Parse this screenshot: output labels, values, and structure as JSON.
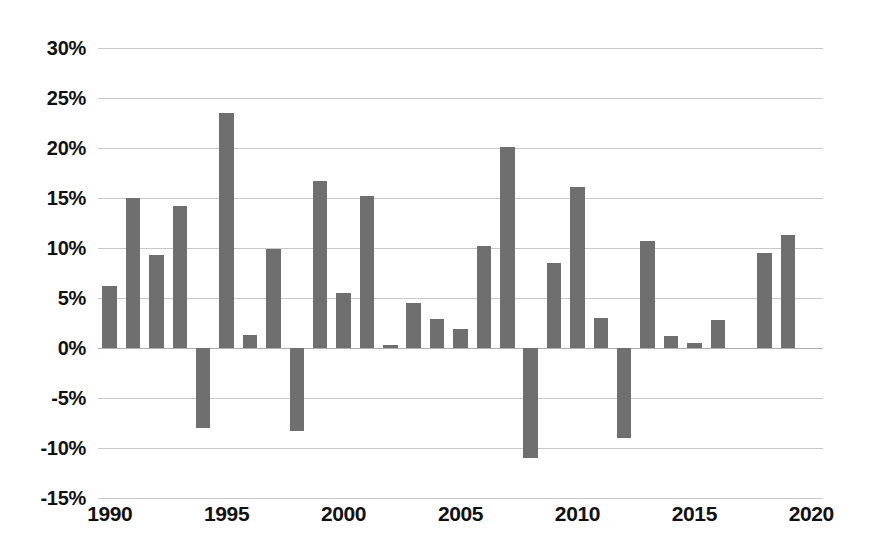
{
  "chart_data": {
    "type": "bar",
    "title": "",
    "subtitle": "",
    "xlabel": "",
    "ylabel": "",
    "categories": [
      "1990",
      "1991",
      "1992",
      "1993",
      "1994",
      "1995",
      "1996",
      "1997",
      "1998",
      "1999",
      "2000",
      "2001",
      "2002",
      "2003",
      "2004",
      "2005",
      "2006",
      "2007",
      "2008",
      "2009",
      "2010",
      "2011",
      "2012",
      "2013",
      "2014",
      "2015",
      "2016",
      "2017",
      "2018",
      "2019"
    ],
    "values": [
      6.2,
      15.0,
      9.3,
      14.2,
      -8.0,
      23.5,
      1.3,
      9.9,
      -8.3,
      16.7,
      5.5,
      15.2,
      0.3,
      4.5,
      2.9,
      1.9,
      10.2,
      20.1,
      -11.0,
      8.5,
      16.1,
      3.0,
      -9.0,
      10.7,
      1.2,
      0.5,
      2.8,
      0.0,
      9.5,
      11.3
    ],
    "ylim": [
      -15,
      30
    ],
    "xlim": [
      1989.5,
      2020.5
    ],
    "y_tick_labels": [
      "30%",
      "25%",
      "20%",
      "15%",
      "10%",
      "5%",
      "0%",
      "-5%",
      "-10%",
      "-15%"
    ],
    "y_tick_values": [
      30,
      25,
      20,
      15,
      10,
      5,
      0,
      -5,
      -10,
      -15
    ],
    "x_tick_labels": [
      "1990",
      "1995",
      "2000",
      "2005",
      "2010",
      "2015",
      "2020"
    ],
    "x_tick_values": [
      1990,
      1995,
      2000,
      2005,
      2010,
      2015,
      2020
    ],
    "grid": true,
    "legend": false,
    "legend_position": "none",
    "series": [
      {
        "name": "",
        "color": "#6f6f6f",
        "values": [
          6.2,
          15.0,
          9.3,
          14.2,
          -8.0,
          23.5,
          1.3,
          9.9,
          -8.3,
          16.7,
          5.5,
          15.2,
          0.3,
          4.5,
          2.9,
          1.9,
          10.2,
          20.1,
          -11.0,
          8.5,
          16.1,
          3.0,
          -9.0,
          10.7,
          1.2,
          0.5,
          2.8,
          0.0,
          9.5,
          11.3
        ]
      }
    ],
    "colors": {
      "bar": "#6f6f6f",
      "grid": "#c9c9c9",
      "zero_line": "#b0b0b0",
      "text": "#111111",
      "background": "#ffffff"
    }
  }
}
